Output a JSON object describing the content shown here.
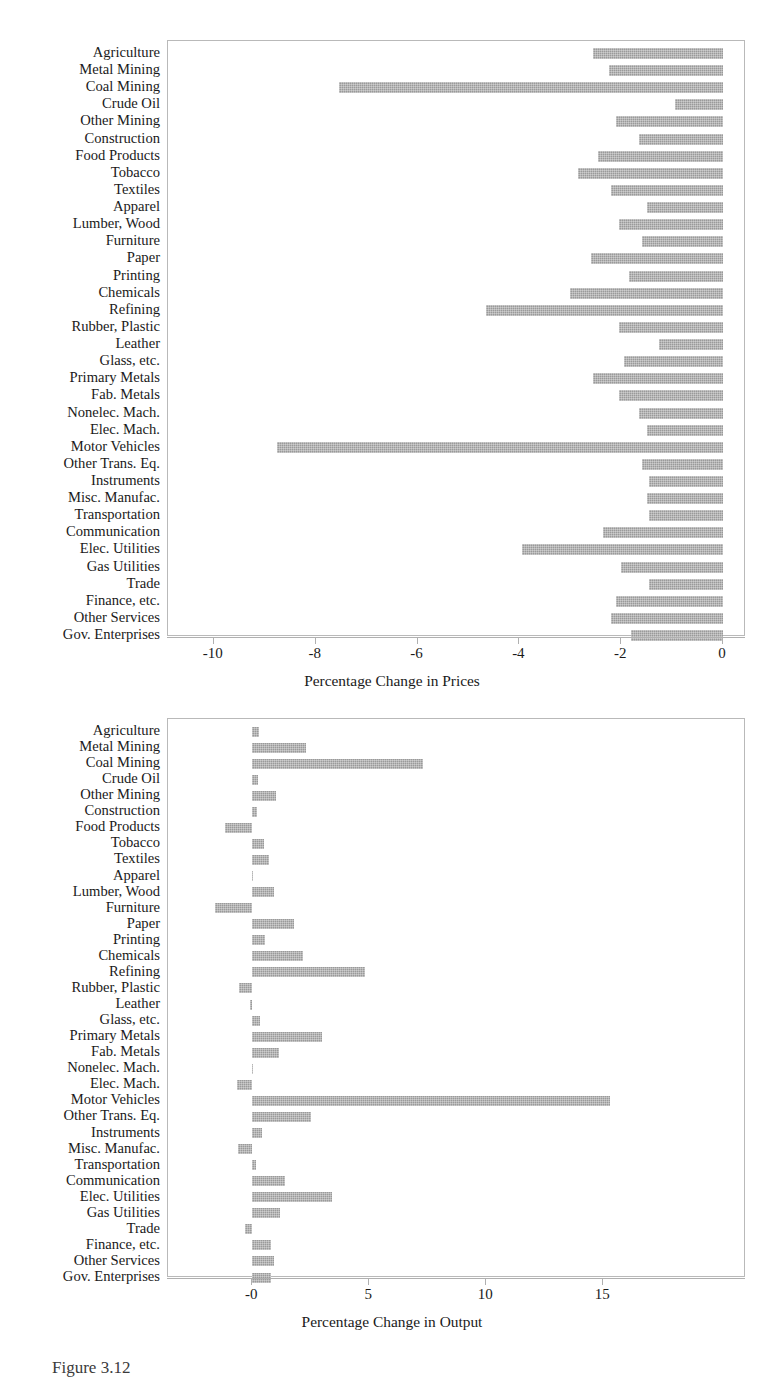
{
  "categories": [
    "Agriculture",
    "Metal Mining",
    "Coal Mining",
    "Crude Oil",
    "Other Mining",
    "Construction",
    "Food Products",
    "Tobacco",
    "Textiles",
    "Apparel",
    "Lumber, Wood",
    "Furniture",
    "Paper",
    "Printing",
    "Chemicals",
    "Refining",
    "Rubber, Plastic",
    "Leather",
    "Glass, etc.",
    "Primary Metals",
    "Fab. Metals",
    "Nonelec. Mach.",
    "Elec. Mach.",
    "Motor Vehicles",
    "Other Trans. Eq.",
    "Instruments",
    "Misc. Manufac.",
    "Transportation",
    "Communication",
    "Elec. Utilities",
    "Gas Utilities",
    "Trade",
    "Finance, etc.",
    "Other Services",
    "Gov. Enterprises"
  ],
  "caption": "Figure 3.12",
  "colors": {
    "bar": "#9a9a9a",
    "frame": "#b9b9b9",
    "axis": "#b0b0b0",
    "text": "#1a1a1a"
  },
  "chart_data": [
    {
      "type": "bar",
      "orientation": "horizontal",
      "title": "",
      "xlabel": "Percentage Change in Prices",
      "ylabel": "",
      "xlim": [
        -10.9,
        0.45
      ],
      "xticks": [
        -10,
        -8,
        -6,
        -4,
        -2,
        0
      ],
      "xticklabels": [
        "-10",
        "-8",
        "-6",
        "-4",
        "-2",
        "0"
      ],
      "grid": false,
      "legend": "none",
      "categories": [
        "Agriculture",
        "Metal Mining",
        "Coal Mining",
        "Crude Oil",
        "Other Mining",
        "Construction",
        "Food Products",
        "Tobacco",
        "Textiles",
        "Apparel",
        "Lumber, Wood",
        "Furniture",
        "Paper",
        "Printing",
        "Chemicals",
        "Refining",
        "Rubber, Plastic",
        "Leather",
        "Glass, etc.",
        "Primary Metals",
        "Fab. Metals",
        "Nonelec. Mach.",
        "Elec. Mach.",
        "Motor Vehicles",
        "Other Trans. Eq.",
        "Instruments",
        "Misc. Manufac.",
        "Transportation",
        "Communication",
        "Elec. Utilities",
        "Gas Utilities",
        "Trade",
        "Finance, etc.",
        "Other Services",
        "Gov. Enterprises"
      ],
      "values": [
        -2.55,
        -2.25,
        -7.55,
        -0.95,
        -2.1,
        -1.65,
        -2.45,
        -2.85,
        -2.2,
        -1.5,
        -2.05,
        -1.6,
        -2.6,
        -1.85,
        -3.0,
        -4.65,
        -2.05,
        -1.25,
        -1.95,
        -2.55,
        -2.05,
        -1.65,
        -1.5,
        -8.75,
        -1.6,
        -1.45,
        -1.5,
        -1.45,
        -2.35,
        -3.95,
        -2.0,
        -1.45,
        -2.1,
        -2.2,
        -1.8
      ]
    },
    {
      "type": "bar",
      "orientation": "horizontal",
      "title": "",
      "xlabel": "Percentage Change in Output",
      "ylabel": "",
      "xlim": [
        -3.6,
        21.1
      ],
      "xticks": [
        0,
        5,
        10,
        15
      ],
      "xticklabels": [
        "-0",
        "5",
        "10",
        "15"
      ],
      "grid": false,
      "legend": "none",
      "categories": [
        "Agriculture",
        "Metal Mining",
        "Coal Mining",
        "Crude Oil",
        "Other Mining",
        "Construction",
        "Food Products",
        "Tobacco",
        "Textiles",
        "Apparel",
        "Lumber, Wood",
        "Furniture",
        "Paper",
        "Printing",
        "Chemicals",
        "Refining",
        "Rubber, Plastic",
        "Leather",
        "Glass, etc.",
        "Primary Metals",
        "Fab. Metals",
        "Nonelec. Mach.",
        "Elec. Mach.",
        "Motor Vehicles",
        "Other Trans. Eq.",
        "Instruments",
        "Misc. Manufac.",
        "Transportation",
        "Communication",
        "Elec. Utilities",
        "Gas Utilities",
        "Trade",
        "Finance, etc.",
        "Other Services",
        "Gov. Enterprises"
      ],
      "values": [
        0.3,
        2.3,
        7.3,
        0.25,
        1.0,
        0.2,
        -1.15,
        0.5,
        0.7,
        0.05,
        0.95,
        -1.6,
        1.8,
        0.55,
        2.15,
        4.8,
        -0.55,
        -0.1,
        0.35,
        3.0,
        1.15,
        0.05,
        -0.65,
        15.3,
        2.5,
        0.4,
        -0.6,
        0.15,
        1.4,
        3.4,
        1.2,
        -0.3,
        0.8,
        0.95,
        0.8
      ]
    }
  ]
}
